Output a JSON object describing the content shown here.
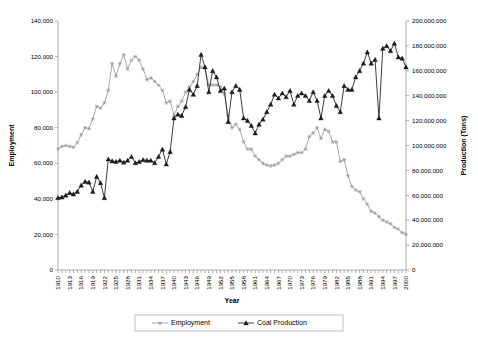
{
  "chart_data": {
    "type": "line",
    "title": "",
    "xlabel": "Year",
    "ylabel": "Employment",
    "y2label": "Production (Tons)",
    "grid": false,
    "legend_position": "bottom",
    "xlim": [
      1910,
      2000
    ],
    "ylim": [
      0,
      140000
    ],
    "y2lim": [
      0,
      200000000
    ],
    "ytick_labels": [
      "0",
      "20,000",
      "40,000",
      "60,000",
      "80,000",
      "100,000",
      "120,000",
      "140,000"
    ],
    "ytick_values": [
      0,
      20000,
      40000,
      60000,
      80000,
      100000,
      120000,
      140000
    ],
    "y2tick_labels": [
      "0",
      "20,000,000",
      "40,000,000",
      "60,000,000",
      "80,000,000",
      "100,000,000",
      "120,000,000",
      "140,000,000",
      "160,000,000",
      "180,000,000",
      "200,000,000"
    ],
    "y2tick_values": [
      0,
      20000000,
      40000000,
      60000000,
      80000000,
      100000000,
      120000000,
      140000000,
      160000000,
      180000000,
      200000000
    ],
    "xtick_labels": [
      "1910",
      "1913",
      "1916",
      "1919",
      "1922",
      "1925",
      "1928",
      "1931",
      "1934",
      "1937",
      "1940",
      "1943",
      "1946",
      "1949",
      "1952",
      "1955",
      "1958",
      "1961",
      "1964",
      "1967",
      "1970",
      "1973",
      "1976",
      "1979",
      "1982",
      "1985",
      "1988",
      "1991",
      "1994",
      "1997",
      "2000"
    ],
    "xtick_step": 3,
    "x": [
      1910,
      1911,
      1912,
      1913,
      1914,
      1915,
      1916,
      1917,
      1918,
      1919,
      1920,
      1921,
      1922,
      1923,
      1924,
      1925,
      1926,
      1927,
      1928,
      1929,
      1930,
      1931,
      1932,
      1933,
      1934,
      1935,
      1936,
      1937,
      1938,
      1939,
      1940,
      1941,
      1942,
      1943,
      1944,
      1945,
      1946,
      1947,
      1948,
      1949,
      1950,
      1951,
      1952,
      1953,
      1954,
      1955,
      1956,
      1957,
      1958,
      1959,
      1960,
      1961,
      1962,
      1963,
      1964,
      1965,
      1966,
      1967,
      1968,
      1969,
      1970,
      1971,
      1972,
      1973,
      1974,
      1975,
      1976,
      1977,
      1978,
      1979,
      1980,
      1981,
      1982,
      1983,
      1984,
      1985,
      1986,
      1987,
      1988,
      1989,
      1990,
      1991,
      1992,
      1993,
      1994,
      1995,
      1996,
      1997,
      1998,
      1999,
      2000
    ],
    "series": [
      {
        "name": "Employment",
        "axis": "left",
        "color": "#9a9a9a",
        "marker": "asterisk",
        "units": "employees",
        "values": [
          68000,
          69500,
          70000,
          69500,
          69000,
          71500,
          76000,
          80000,
          79500,
          85000,
          92000,
          91000,
          94000,
          101000,
          116000,
          109000,
          116000,
          121000,
          113000,
          118000,
          120000,
          118000,
          113000,
          107000,
          108000,
          106000,
          104000,
          101000,
          94000,
          95000,
          87000,
          92000,
          95000,
          100000,
          103000,
          106000,
          110000,
          114000,
          114000,
          104000,
          104000,
          104000,
          103000,
          99000,
          87000,
          80000,
          82000,
          79000,
          72000,
          68000,
          68000,
          64000,
          62000,
          60000,
          59000,
          58500,
          59000,
          60000,
          62000,
          64000,
          64000,
          65000,
          66000,
          66000,
          68000,
          75000,
          77000,
          80000,
          74000,
          79000,
          78000,
          72000,
          72000,
          61000,
          62000,
          53000,
          47000,
          45000,
          44000,
          40000,
          37000,
          33000,
          32000,
          30000,
          28000,
          27000,
          26000,
          24000,
          23000,
          21000,
          20000
        ]
      },
      {
        "name": "Coal Production",
        "axis": "right",
        "color": "#1a1a1a",
        "marker": "triangle",
        "units": "tons",
        "values": [
          58000000,
          58500000,
          60000000,
          62000000,
          61000000,
          63000000,
          68000000,
          71000000,
          70500000,
          63000000,
          75000000,
          70000000,
          58000000,
          89000000,
          87500000,
          87000000,
          88000000,
          86500000,
          88000000,
          91000000,
          86000000,
          87000000,
          88500000,
          88000000,
          88000000,
          86000000,
          91000000,
          97000000,
          85000000,
          95000000,
          122000000,
          125000000,
          124000000,
          131000000,
          145000000,
          141000000,
          148000000,
          173000000,
          163000000,
          143000000,
          160000000,
          155000000,
          144000000,
          146000000,
          119000000,
          143000000,
          148000000,
          145000000,
          122000000,
          120000000,
          116000000,
          110000000,
          117000000,
          121000000,
          127000000,
          133000000,
          141000000,
          138000000,
          142000000,
          139000000,
          144000000,
          133000000,
          140000000,
          142000000,
          140000000,
          136000000,
          143000000,
          136000000,
          122000000,
          140000000,
          144000000,
          140000000,
          132000000,
          127000000,
          148000000,
          145000000,
          145000000,
          155000000,
          160000000,
          166000000,
          175000000,
          166000000,
          169000000,
          122000000,
          178000000,
          180000000,
          176000000,
          182000000,
          171000000,
          170000000,
          163000000
        ]
      }
    ]
  },
  "legend": {
    "items": [
      {
        "label": "Employment",
        "color": "#9a9a9a",
        "marker": "asterisk"
      },
      {
        "label": "Coal Production",
        "color": "#1a1a1a",
        "marker": "triangle"
      }
    ]
  },
  "axes": {
    "y_left_title": "Employment",
    "y_right_title": "Production (Tons)",
    "x_title": "Year"
  }
}
